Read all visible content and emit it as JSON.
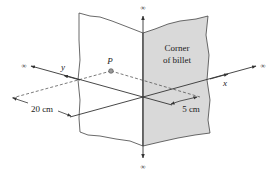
{
  "diagram": {
    "panel_label_line1": "Corner",
    "panel_label_line2": "of billet",
    "point_label": "P",
    "axis_x_label": "x",
    "axis_y_label": "y",
    "infinity_top": "∞",
    "infinity_bottom": "∞",
    "infinity_left": "∞",
    "infinity_right": "∞",
    "dimension_left": "20 cm",
    "dimension_right": "5 cm",
    "colors": {
      "billet_fill": "#d9d9d9",
      "panel_fill": "#ffffff",
      "line": "#333333",
      "point_fill": "#9a9a9a"
    }
  }
}
